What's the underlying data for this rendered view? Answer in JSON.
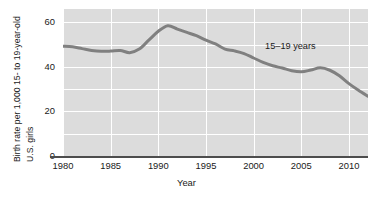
{
  "chart_data": {
    "type": "line",
    "title": "",
    "xlabel": "Year",
    "ylabel": "Birth rate per 1,000 15- to 19-year-old U.S. girls",
    "ylabel_line1": "Birth rate per 1,000 15- to 19-year-old",
    "ylabel_line2": "U.S. girls",
    "xlim": [
      1980,
      2012
    ],
    "ylim": [
      0,
      66
    ],
    "grid": true,
    "legend_position": "inline-annotation",
    "x_ticks": [
      "1980",
      "1985",
      "1990",
      "1995",
      "2000",
      "2005",
      "2010"
    ],
    "x_tick_values": [
      1980,
      1985,
      1990,
      1995,
      2000,
      2005,
      2010
    ],
    "y_ticks": [
      "0",
      "20",
      "40",
      "60"
    ],
    "y_tick_values": [
      0,
      20,
      40,
      60
    ],
    "y_gridline_values": [
      0,
      10,
      20,
      30,
      40,
      50,
      60
    ],
    "series": [
      {
        "name": "15–19 years",
        "annotation": "15–19 years",
        "color": "#808080",
        "x": [
          1980,
          1981,
          1982,
          1983,
          1984,
          1985,
          1986,
          1987,
          1988,
          1989,
          1990,
          1991,
          1992,
          1993,
          1994,
          1995,
          1996,
          1997,
          1998,
          1999,
          2000,
          2001,
          2002,
          2003,
          2004,
          2005,
          2006,
          2007,
          2008,
          2009,
          2010,
          2011,
          2012
        ],
        "values": [
          49.3,
          49.0,
          48.2,
          47.4,
          47.0,
          47.1,
          47.4,
          46.4,
          48.0,
          52.0,
          56.0,
          58.5,
          57.0,
          55.5,
          54.0,
          52.0,
          50.3,
          48.0,
          47.2,
          46.0,
          44.0,
          42.0,
          40.5,
          39.5,
          38.3,
          37.8,
          38.6,
          39.6,
          38.5,
          36.0,
          32.5,
          29.5,
          26.8
        ]
      }
    ]
  }
}
